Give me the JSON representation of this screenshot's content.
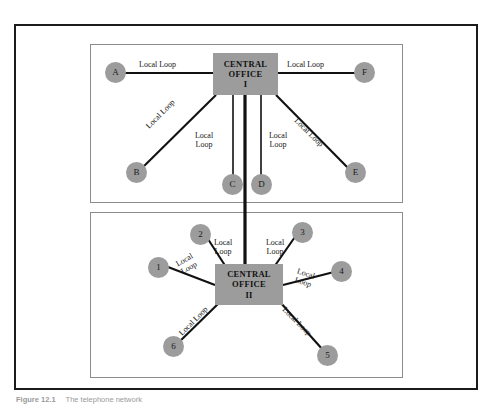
{
  "figure": {
    "caption_number": "Figure  12.1",
    "caption_text": "The telephone network"
  },
  "colors": {
    "node_fill": "#9c9c9c",
    "office_fill": "#9c9c9c",
    "line": "#111111",
    "outer_frame": "#1b1b1b",
    "panel_border": "#8c8c8c",
    "text": "#151515"
  },
  "upper_panel": {
    "central_office": {
      "line1": "CENTRAL",
      "line2": "OFFICE",
      "line3": "I"
    },
    "nodes": [
      {
        "label": "A"
      },
      {
        "label": "B"
      },
      {
        "label": "C"
      },
      {
        "label": "D"
      },
      {
        "label": "E"
      },
      {
        "label": "F"
      }
    ],
    "links": [
      {
        "from": "A",
        "to": "CENTRAL OFFICE I",
        "label": "Local Loop"
      },
      {
        "from": "B",
        "to": "CENTRAL OFFICE I",
        "label": "Local Loop"
      },
      {
        "from": "C",
        "to": "CENTRAL OFFICE I",
        "label": "Local Loop"
      },
      {
        "from": "D",
        "to": "CENTRAL OFFICE I",
        "label": "Local Loop"
      },
      {
        "from": "E",
        "to": "CENTRAL OFFICE I",
        "label": "Local Loop"
      },
      {
        "from": "F",
        "to": "CENTRAL OFFICE I",
        "label": "Local Loop"
      }
    ],
    "labels": {
      "a_loop": "Local Loop",
      "f_loop": "Local Loop",
      "b_loop": "Local Loop",
      "e_loop": "Local Loop",
      "c_loop_l1": "Local",
      "c_loop_l2": "Loop",
      "d_loop_l1": "Local",
      "d_loop_l2": "Loop"
    }
  },
  "lower_panel": {
    "central_office": {
      "line1": "CENTRAL",
      "line2": "OFFICE",
      "line3": "II"
    },
    "nodes": [
      {
        "label": "1"
      },
      {
        "label": "2"
      },
      {
        "label": "3"
      },
      {
        "label": "4"
      },
      {
        "label": "5"
      },
      {
        "label": "6"
      }
    ],
    "links": [
      {
        "from": "1",
        "to": "CENTRAL OFFICE II",
        "label": "Local Loop"
      },
      {
        "from": "2",
        "to": "CENTRAL OFFICE II",
        "label": "Local Loop"
      },
      {
        "from": "3",
        "to": "CENTRAL OFFICE II",
        "label": "Local Loop"
      },
      {
        "from": "4",
        "to": "CENTRAL OFFICE II",
        "label": "Local Loop"
      },
      {
        "from": "5",
        "to": "CENTRAL OFFICE II",
        "label": "Local Loop"
      },
      {
        "from": "6",
        "to": "CENTRAL OFFICE II",
        "label": "Local Loop"
      }
    ],
    "labels": {
      "n1_l1": "Local",
      "n1_l2": "Loop",
      "n2_l1": "Local",
      "n2_l2": "Loop",
      "n3_l1": "Local",
      "n3_l2": "Loop",
      "n4_l1": "Local",
      "n4_l2": "Loop",
      "n5_loop": "Local Loop",
      "n6_loop": "Local Loop"
    }
  },
  "trunk": {
    "description": "trunk-line-between-offices"
  }
}
